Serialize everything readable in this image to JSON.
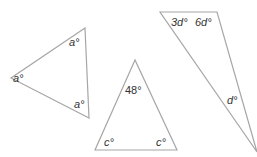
{
  "triangles": [
    {
      "name": "equilateral",
      "points": "85,28 11,78 89,118",
      "labels": [
        {
          "text": "a°",
          "x": 69,
          "y": 46
        },
        {
          "text": "a°",
          "x": 22,
          "y": 80
        },
        {
          "text": "a°",
          "x": 74,
          "y": 108
        }
      ]
    },
    {
      "name": "isosceles",
      "points": "135,60 95,150 177,150",
      "labels": [
        {
          "text": "48°",
          "x": 125,
          "y": 94
        },
        {
          "text": "c°",
          "x": 105,
          "y": 146
        },
        {
          "text": "c°",
          "x": 155,
          "y": 146
        }
      ]
    },
    {
      "name": "scalene",
      "points": "160,12 217,12 257,152",
      "labels": [
        {
          "text": "3d°",
          "x": 172,
          "y": 25
        },
        {
          "text": "6d°",
          "x": 196,
          "y": 25
        },
        {
          "text": "d°",
          "x": 227,
          "y": 104
        }
      ]
    }
  ],
  "style": {
    "stroke": "#a6a6a6",
    "text": "#333333"
  }
}
